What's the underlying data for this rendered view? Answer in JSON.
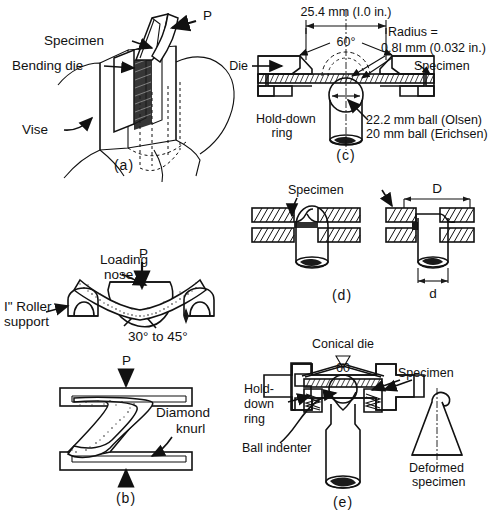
{
  "figure": {
    "background_color": "#ffffff",
    "ink_color": "#111111"
  },
  "panels": [
    {
      "id": "a",
      "caption": "(a)",
      "name": "vise-bending-test",
      "labels": [
        {
          "key": "load",
          "text": "P"
        },
        {
          "key": "specimen",
          "text": "Specimen"
        },
        {
          "key": "bending_die",
          "text": "Bending die"
        },
        {
          "key": "vise",
          "text": "Vise"
        }
      ]
    },
    {
      "id": "b",
      "caption": "(b)",
      "name": "three-point-and-compression-bend-test",
      "labels": [
        {
          "key": "load_top",
          "text": "P"
        },
        {
          "key": "loading_nose",
          "text": "Loading"
        },
        {
          "key": "loading_nose2",
          "text": "nose"
        },
        {
          "key": "roller_support",
          "text": "I\" Roller"
        },
        {
          "key": "roller_support2",
          "text": "support"
        },
        {
          "key": "angle",
          "text": "30° to 45°"
        },
        {
          "key": "load_bottom",
          "text": "P"
        },
        {
          "key": "knurl",
          "text": "Diamond"
        },
        {
          "key": "knurl2",
          "text": "knurl"
        }
      ]
    },
    {
      "id": "c",
      "caption": "(c)",
      "name": "olsen-erichsen-cup-test",
      "labels": [
        {
          "key": "width_dim",
          "text": "25.4 mm (I.0 in.)"
        },
        {
          "key": "angle",
          "text": "60°"
        },
        {
          "key": "radius_1",
          "text": "Radius ="
        },
        {
          "key": "radius_2",
          "text": "0.8I mm (0.032 in.)"
        },
        {
          "key": "die",
          "text": "Die"
        },
        {
          "key": "specimen",
          "text": "Specimen"
        },
        {
          "key": "holddown_1",
          "text": "Hold-down"
        },
        {
          "key": "holddown_2",
          "text": "ring"
        },
        {
          "key": "ball_1",
          "text": "22.2 mm ball (Olsen)"
        },
        {
          "key": "ball_2",
          "text": "20 mm ball (Erichsen)"
        }
      ]
    },
    {
      "id": "d",
      "caption": "(d)",
      "name": "hole-expansion-dome-test",
      "labels": [
        {
          "key": "specimen",
          "text": "Specimen"
        },
        {
          "key": "dim_D",
          "text": "D"
        },
        {
          "key": "dim_d",
          "text": "d"
        }
      ]
    },
    {
      "id": "e",
      "caption": "(e)",
      "name": "conical-die-fukui-test",
      "labels": [
        {
          "key": "conical_die",
          "text": "Conical die"
        },
        {
          "key": "angle",
          "text": "60"
        },
        {
          "key": "specimen",
          "text": "Specimen"
        },
        {
          "key": "holddown_1",
          "text": "Hold-"
        },
        {
          "key": "holddown_2",
          "text": "down"
        },
        {
          "key": "holddown_3",
          "text": "ring"
        },
        {
          "key": "ball_indenter",
          "text": "Ball indenter"
        },
        {
          "key": "deformed_1",
          "text": "Deformed"
        },
        {
          "key": "deformed_2",
          "text": "specimen"
        }
      ]
    }
  ]
}
